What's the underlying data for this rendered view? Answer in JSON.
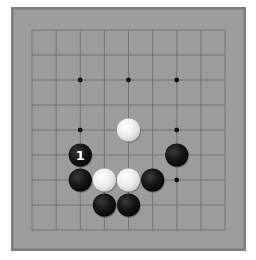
{
  "board": {
    "size": 9,
    "grid_origin_x": 32,
    "grid_origin_y": 30,
    "spacing_x": 24.125,
    "spacing_y": 25,
    "colors": {
      "background": "#ffffff",
      "board_fill": "#9c9c9c",
      "board_border": "#7e7e7e",
      "grid_line": "#6f6f6f",
      "star_point": "#111111",
      "black_stone": "#111111",
      "white_stone": "#ececec",
      "label_on_black": "#ffffff"
    },
    "star_points": [
      {
        "col": 2,
        "row": 2
      },
      {
        "col": 4,
        "row": 2
      },
      {
        "col": 6,
        "row": 2
      },
      {
        "col": 2,
        "row": 4
      },
      {
        "col": 4,
        "row": 4
      },
      {
        "col": 6,
        "row": 4
      },
      {
        "col": 2,
        "row": 6
      },
      {
        "col": 4,
        "row": 6
      },
      {
        "col": 6,
        "row": 6
      }
    ],
    "stones": [
      {
        "color": "white",
        "col": 4,
        "row": 4,
        "label": ""
      },
      {
        "color": "black",
        "col": 2,
        "row": 5,
        "label": "1"
      },
      {
        "color": "black",
        "col": 6,
        "row": 5,
        "label": ""
      },
      {
        "color": "black",
        "col": 2,
        "row": 6,
        "label": ""
      },
      {
        "color": "white",
        "col": 3,
        "row": 6,
        "label": ""
      },
      {
        "color": "white",
        "col": 4,
        "row": 6,
        "label": ""
      },
      {
        "color": "black",
        "col": 5,
        "row": 6,
        "label": ""
      },
      {
        "color": "black",
        "col": 3,
        "row": 7,
        "label": ""
      },
      {
        "color": "black",
        "col": 4,
        "row": 7,
        "label": ""
      }
    ]
  }
}
